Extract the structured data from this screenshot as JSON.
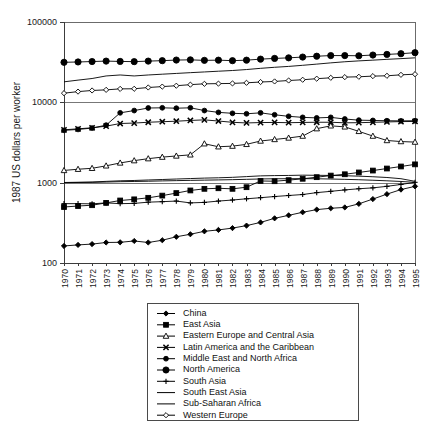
{
  "chart_data": {
    "type": "line",
    "title": "",
    "subtitle": "",
    "xlabel": "",
    "ylabel": "1987 US dollars per worker",
    "x": [
      1970,
      1971,
      1972,
      1973,
      1974,
      1975,
      1976,
      1977,
      1978,
      1979,
      1980,
      1981,
      1982,
      1983,
      1984,
      1985,
      1986,
      1987,
      1988,
      1989,
      1990,
      1991,
      1992,
      1993,
      1994,
      1995
    ],
    "x_tick_labels": [
      "1970",
      "1971",
      "1972",
      "1973",
      "1974",
      "1975",
      "1976",
      "1977",
      "1978",
      "1979",
      "1980",
      "1981",
      "1982",
      "1983",
      "1984",
      "1985",
      "1986",
      "1987",
      "1988",
      "1989",
      "1990",
      "1991",
      "1992",
      "1993",
      "1994",
      "1995"
    ],
    "y_tick_labels": [
      "100",
      "1000",
      "10000",
      "100000"
    ],
    "y_ticks": [
      100,
      1000,
      10000,
      100000
    ],
    "yscale": "log",
    "ylim": [
      100,
      100000
    ],
    "xlim": [
      1970,
      1995
    ],
    "grid": "horizontal-major",
    "legend_position": "below-plot",
    "series": [
      {
        "name": "China",
        "marker": "filled-diamond",
        "values": [
          163,
          168,
          172,
          180,
          181,
          188,
          180,
          192,
          212,
          228,
          248,
          258,
          272,
          292,
          320,
          360,
          392,
          428,
          462,
          480,
          492,
          545,
          625,
          720,
          820,
          900
        ]
      },
      {
        "name": "East Asia",
        "marker": "filled-square",
        "values": [
          498,
          512,
          524,
          560,
          600,
          620,
          648,
          690,
          742,
          800,
          838,
          852,
          838,
          878,
          1050,
          1042,
          1075,
          1118,
          1170,
          1225,
          1272,
          1340,
          1415,
          1500,
          1590,
          1690
        ]
      },
      {
        "name": "Eastern Europe and Central Asia",
        "marker": "open-triangle",
        "values": [
          1420,
          1470,
          1510,
          1620,
          1760,
          1880,
          1990,
          2080,
          2150,
          2220,
          3050,
          2800,
          2850,
          3000,
          3300,
          3450,
          3600,
          3800,
          4700,
          5100,
          4950,
          4350,
          3800,
          3350,
          3250,
          3200
        ]
      },
      {
        "name": "Latin America and the Caribbean",
        "marker": "x-cross",
        "values": [
          4550,
          4680,
          4820,
          5050,
          5450,
          5520,
          5650,
          5740,
          5820,
          5950,
          6050,
          5850,
          5640,
          5540,
          5600,
          5620,
          5580,
          5620,
          5650,
          5650,
          5560,
          5580,
          5640,
          5700,
          5760,
          5780
        ]
      },
      {
        "name": "Middle East and North Africa",
        "marker": "filled-circle-small",
        "values": [
          4480,
          4600,
          4780,
          5200,
          7400,
          7900,
          8500,
          8550,
          8450,
          8550,
          7900,
          7500,
          7300,
          7200,
          7400,
          7000,
          6700,
          6500,
          6400,
          6500,
          6200,
          6000,
          5950,
          5900,
          5880,
          5900
        ]
      },
      {
        "name": "North America",
        "marker": "filled-circle",
        "values": [
          31500,
          31800,
          32200,
          32600,
          32300,
          32100,
          32600,
          33000,
          33600,
          33800,
          33300,
          33500,
          33000,
          33500,
          34500,
          35200,
          35800,
          36600,
          37500,
          38200,
          38200,
          38000,
          38800,
          39500,
          40300,
          41500
        ]
      },
      {
        "name": "South Asia",
        "marker": "plus",
        "values": [
          548,
          548,
          545,
          560,
          548,
          552,
          572,
          580,
          590,
          560,
          568,
          590,
          608,
          630,
          650,
          672,
          692,
          712,
          752,
          780,
          812,
          840,
          862,
          900,
          950,
          1010
        ]
      },
      {
        "name": "South East Asia",
        "marker": "line-only",
        "values": [
          1005,
          1012,
          1020,
          1038,
          1055,
          1065,
          1080,
          1095,
          1110,
          1125,
          1140,
          1150,
          1165,
          1190,
          1215,
          1225,
          1230,
          1240,
          1235,
          1230,
          1220,
          1205,
          1185,
          1160,
          1120,
          1040
        ]
      },
      {
        "name": "Sub-Saharan Africa",
        "marker": "line-only",
        "values": [
          1000,
          1005,
          1008,
          1018,
          1028,
          1035,
          1042,
          1052,
          1060,
          1068,
          1075,
          1082,
          1090,
          1100,
          1112,
          1118,
          1120,
          1122,
          1118,
          1110,
          1100,
          1088,
          1072,
          1055,
          1035,
          1010
        ]
      },
      {
        "name": "Western Europe",
        "marker": "open-diamond",
        "values": [
          13000,
          13600,
          14050,
          14300,
          14700,
          14750,
          15300,
          15700,
          16100,
          16600,
          17000,
          17100,
          17200,
          17500,
          17900,
          18200,
          18700,
          19100,
          19700,
          20200,
          20600,
          20800,
          21200,
          21400,
          22000,
          22400
        ]
      },
      {
        "name": "unlabeled-upper-trend",
        "marker": "line-only",
        "values": [
          18000,
          18900,
          19800,
          21300,
          21900,
          21300,
          21900,
          22400,
          22900,
          23400,
          23900,
          24400,
          24900,
          25600,
          26500,
          27300,
          28000,
          28900,
          29900,
          31000,
          32000,
          32800,
          33500,
          34300,
          35000,
          35800
        ]
      }
    ],
    "legend_entries": [
      {
        "label": "China",
        "marker": "filled-diamond"
      },
      {
        "label": "East Asia",
        "marker": "filled-square"
      },
      {
        "label": "Eastern Europe and Central Asia",
        "marker": "open-triangle"
      },
      {
        "label": "Latin America and the Caribbean",
        "marker": "x-cross"
      },
      {
        "label": "Middle East and North Africa",
        "marker": "filled-circle-small"
      },
      {
        "label": "North America",
        "marker": "filled-circle"
      },
      {
        "label": "South Asia",
        "marker": "plus"
      },
      {
        "label": "South East Asia",
        "marker": "line-only"
      },
      {
        "label": "Sub-Saharan Africa",
        "marker": "line-only"
      },
      {
        "label": "Western Europe",
        "marker": "open-diamond"
      }
    ]
  },
  "colors": {
    "ink": "#000000",
    "axis": "#3c3c3c",
    "grid": "#777777",
    "background": "#ffffff",
    "legend_border": "#4a4a4a"
  }
}
